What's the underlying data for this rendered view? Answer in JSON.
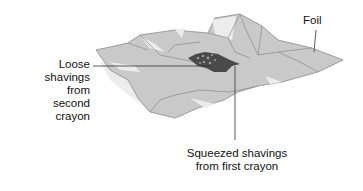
{
  "labels": {
    "foil": "Foil",
    "loose": {
      "lines": [
        "Loose",
        "shavings",
        "from second",
        "crayon"
      ]
    },
    "squeezed": {
      "lines": [
        "Squeezed shavings",
        "from first crayon"
      ]
    }
  },
  "colors": {
    "foil_fill": "#c9c9c9",
    "foil_highlight": "#ececec",
    "foil_edge": "#8a8a8a",
    "shavings": "#4a4a4a",
    "leader_line": "#333333",
    "shadow": "#e2e2e2"
  }
}
